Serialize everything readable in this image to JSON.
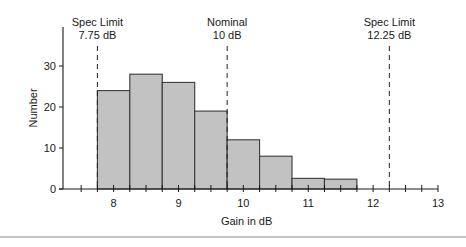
{
  "chart_data": {
    "type": "bar",
    "subtype": "histogram",
    "title": "",
    "xlabel": "Gain in dB",
    "ylabel": "Number",
    "xlim": [
      7.22,
      13
    ],
    "ylim": [
      0,
      38
    ],
    "xticks_major": [
      8,
      9,
      10,
      11,
      12,
      13
    ],
    "xtick_labels": [
      "8",
      "9",
      "10",
      "11",
      "12",
      "13"
    ],
    "xticks_minor_step": 0.25,
    "yticks": [
      0,
      10,
      20,
      30
    ],
    "ytick_labels": [
      "0",
      "10",
      "20",
      "30"
    ],
    "grid": false,
    "legend": "none",
    "bin_width": 0.5,
    "bins": [
      {
        "start": 7.75,
        "end": 8.25,
        "value": 24
      },
      {
        "start": 8.25,
        "end": 8.75,
        "value": 28
      },
      {
        "start": 8.75,
        "end": 9.25,
        "value": 26
      },
      {
        "start": 9.25,
        "end": 9.75,
        "value": 19
      },
      {
        "start": 9.75,
        "end": 10.25,
        "value": 12
      },
      {
        "start": 10.25,
        "end": 10.75,
        "value": 8
      },
      {
        "start": 10.75,
        "end": 11.25,
        "value": 2.6
      },
      {
        "start": 11.25,
        "end": 11.75,
        "value": 2.4
      }
    ],
    "annotations": [
      {
        "x": 7.75,
        "line1": "Spec Limit",
        "line2": "7.75 dB",
        "style": "dashed"
      },
      {
        "x": 9.75,
        "line1": "Nominal",
        "line2": "10 dB",
        "style": "dashed"
      },
      {
        "x": 12.25,
        "line1": "Spec Limit",
        "line2": "12.25 dB",
        "style": "dashed"
      }
    ],
    "colors": {
      "bar_fill": "#c2c2c2",
      "bar_stroke": "#3a3a3a",
      "axis": "#1a1a1a",
      "divider": "#b0b0b0"
    }
  }
}
